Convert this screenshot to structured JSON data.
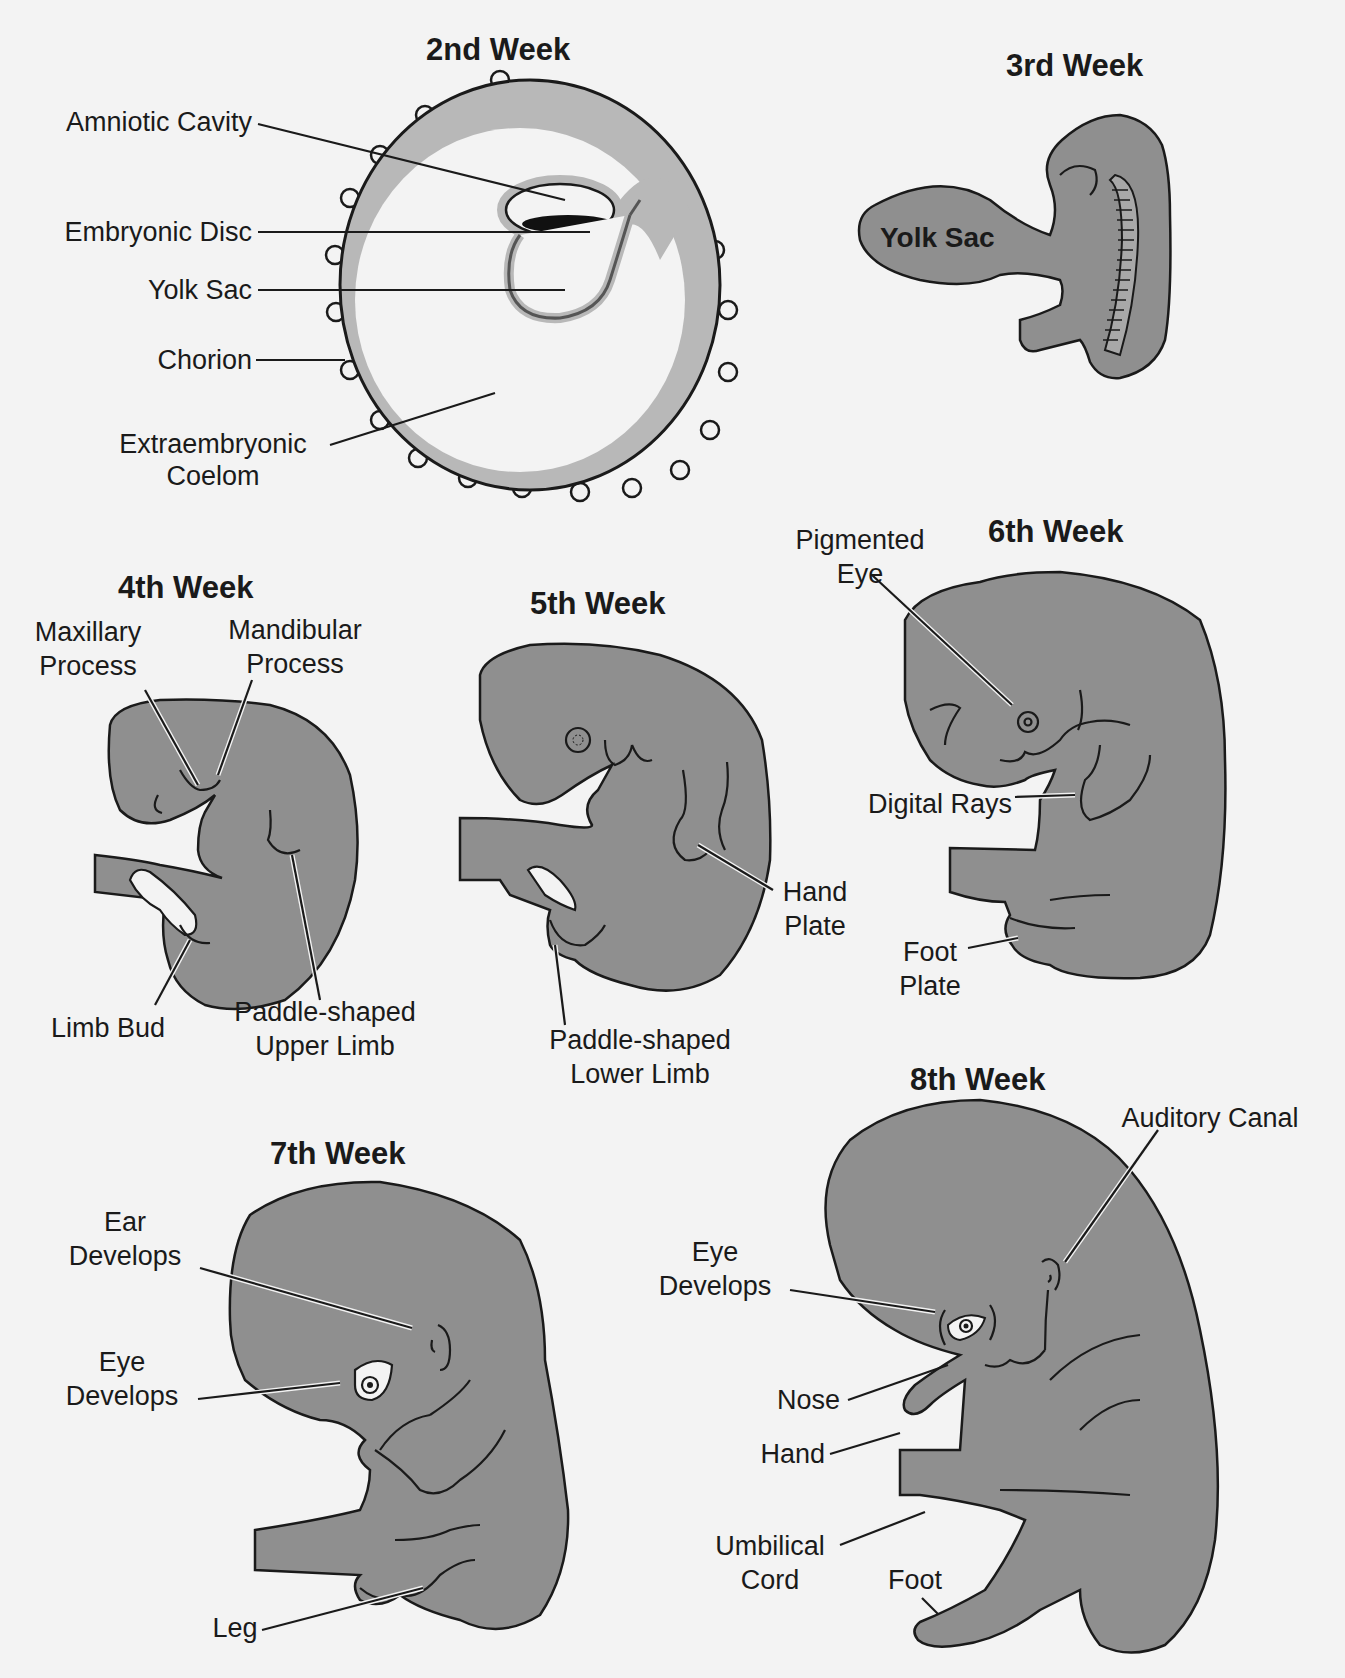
{
  "figure": {
    "background": "#f3f3f3",
    "embryo_fill": "#8f8f8f",
    "chorion_fill": "#b8b8b8",
    "outline": "#1a1a1a"
  },
  "stages": [
    {
      "id": "week2",
      "title": "2nd Week",
      "labels": [
        "Amniotic Cavity",
        "Embryonic Disc",
        "Yolk Sac",
        "Chorion",
        "Extraembryonic",
        "Coelom"
      ]
    },
    {
      "id": "week3",
      "title": "3rd Week",
      "labels": [
        "Yolk Sac"
      ]
    },
    {
      "id": "week4",
      "title": "4th Week",
      "labels": [
        "Maxillary",
        "Process",
        "Mandibular",
        "Process",
        "Limb Bud",
        "Paddle-shaped",
        "Upper Limb"
      ]
    },
    {
      "id": "week5",
      "title": "5th Week",
      "labels": [
        "Hand",
        "Plate",
        "Paddle-shaped",
        "Lower Limb"
      ]
    },
    {
      "id": "week6",
      "title": "6th Week",
      "labels": [
        "Pigmented",
        "Eye",
        "Digital Rays",
        "Foot",
        "Plate"
      ]
    },
    {
      "id": "week7",
      "title": "7th Week",
      "labels": [
        "Ear",
        "Develops",
        "Eye",
        "Develops",
        "Leg"
      ]
    },
    {
      "id": "week8",
      "title": "8th Week",
      "labels": [
        "Auditory Canal",
        "Eye",
        "Develops",
        "Nose",
        "Hand",
        "Umbilical",
        "Cord",
        "Foot"
      ]
    }
  ]
}
